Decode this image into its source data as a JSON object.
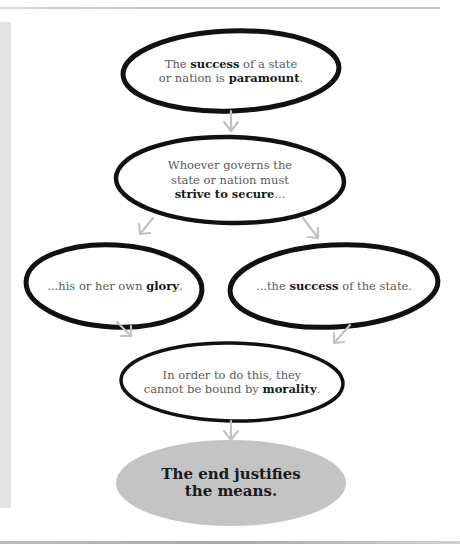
{
  "colors": {
    "outline": "#111111",
    "arrow": "#c2c2c2",
    "final_fill": "#c4c4c4",
    "side_strip": "#e4e4e4",
    "text": "#5a5a5a",
    "bold_text": "#1a1a1a"
  },
  "nodes": [
    {
      "id": "premise",
      "parts": [
        {
          "t": "The ",
          "b": false
        },
        {
          "t": "success",
          "b": true
        },
        {
          "t": " of a state",
          "b": false
        },
        {
          "br": true
        },
        {
          "t": "or nation is ",
          "b": false
        },
        {
          "t": "paramount",
          "b": true
        },
        {
          "t": ".",
          "b": false
        }
      ]
    },
    {
      "id": "ruler-duty",
      "parts": [
        {
          "t": "Whoever governs the",
          "b": false
        },
        {
          "br": true
        },
        {
          "t": "state or nation must",
          "b": false
        },
        {
          "br": true
        },
        {
          "t": "strive to secure",
          "b": true
        },
        {
          "t": "...",
          "b": false
        }
      ]
    },
    {
      "id": "own-glory",
      "parts": [
        {
          "t": "...his or her own ",
          "b": false
        },
        {
          "t": "glory",
          "b": true
        },
        {
          "t": ".",
          "b": false
        }
      ]
    },
    {
      "id": "state-success",
      "parts": [
        {
          "t": "...the ",
          "b": false
        },
        {
          "t": "success",
          "b": true
        },
        {
          "t": " of the state.",
          "b": false
        }
      ]
    },
    {
      "id": "no-morality",
      "parts": [
        {
          "t": "In order to do this, they",
          "b": false
        },
        {
          "br": true
        },
        {
          "t": "cannot be bound by ",
          "b": false
        },
        {
          "t": "morality",
          "b": true
        },
        {
          "t": ".",
          "b": false
        }
      ]
    },
    {
      "id": "conclusion",
      "parts": [
        {
          "t": "The end justifies",
          "b": true
        },
        {
          "br": true
        },
        {
          "t": "the means.",
          "b": true
        }
      ]
    }
  ],
  "edges": [
    {
      "from": "premise",
      "to": "ruler-duty"
    },
    {
      "from": "ruler-duty",
      "to": "own-glory"
    },
    {
      "from": "ruler-duty",
      "to": "state-success"
    },
    {
      "from": "own-glory",
      "to": "no-morality"
    },
    {
      "from": "state-success",
      "to": "no-morality"
    },
    {
      "from": "no-morality",
      "to": "conclusion"
    }
  ]
}
